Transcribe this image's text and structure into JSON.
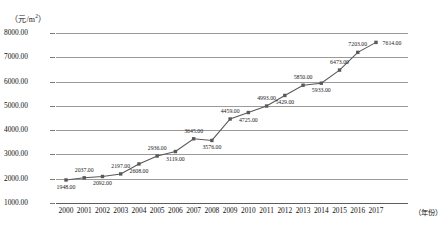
{
  "chart_data": {
    "type": "line",
    "title": "",
    "subtitle": "",
    "xlabel": "（年份）",
    "ylabel": "（元/m²）",
    "ylim": [
      1000,
      8000
    ],
    "ytick_step": 1000,
    "yticks": [
      "1000.00",
      "2000.00",
      "3000.00",
      "4000.00",
      "5000.00",
      "6000.00",
      "7000.00",
      "8000.00"
    ],
    "grid": true,
    "legend": "none",
    "categories": [
      "2000",
      "2001",
      "2002",
      "2003",
      "2004",
      "2005",
      "2006",
      "2007",
      "2008",
      "2009",
      "2010",
      "2011",
      "2012",
      "2013",
      "2014",
      "2015",
      "2016",
      "2017"
    ],
    "values": [
      1948,
      2037,
      2092,
      2197,
      2608,
      2936,
      3119,
      3645,
      3576,
      4459,
      4725,
      4993,
      5429,
      5850,
      5933,
      6473,
      7203,
      7614
    ],
    "point_labels": [
      "1948.00",
      "2037.00",
      "2092.00",
      "2197.00",
      "2608.00",
      "2936.00",
      "3119.00",
      "3645.00",
      "3576.00",
      "4459.00",
      "4725.00",
      "4993.00",
      "5429.00",
      "5850.00",
      "5933.00",
      "6473.00",
      "7203.00",
      "7614.00"
    ],
    "label_positions": [
      "below",
      "above",
      "below",
      "above",
      "below",
      "above",
      "below",
      "above",
      "below",
      "above",
      "below",
      "above",
      "below",
      "above",
      "below",
      "above",
      "above",
      "right"
    ],
    "series_color": "#595959",
    "marker": "square",
    "grid_color": "#9a9a9a",
    "axis_color": "#5d5d5d"
  }
}
